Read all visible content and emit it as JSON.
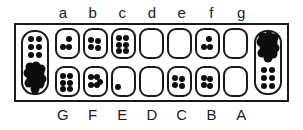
{
  "figure": {
    "board_type": "kalah",
    "frame_color": "#1a1a1a",
    "seed_color": "#0d0d0d",
    "background_color": "#ffffff"
  },
  "labels": {
    "top_row": [
      "a",
      "b",
      "c",
      "d",
      "e",
      "f",
      "g"
    ],
    "bottom_row": [
      "G",
      "F",
      "E",
      "D",
      "C",
      "B",
      "A"
    ]
  },
  "stores": {
    "left": {
      "name": "left-store",
      "upper_count": 6,
      "lower_count": 13,
      "total": 19
    },
    "right": {
      "name": "right-store",
      "upper_count": 13,
      "lower_count": 6,
      "total": 19
    }
  },
  "pits": {
    "top": [
      {
        "label": "a",
        "count": 3
      },
      {
        "label": "b",
        "count": 4
      },
      {
        "label": "c",
        "count": 6
      },
      {
        "label": "d",
        "count": 0
      },
      {
        "label": "e",
        "count": 0
      },
      {
        "label": "f",
        "count": 3
      },
      {
        "label": "g",
        "count": 0
      }
    ],
    "bottom": [
      {
        "label": "G",
        "count": 6
      },
      {
        "label": "F",
        "count": 5
      },
      {
        "label": "E",
        "count": 1
      },
      {
        "label": "D",
        "count": 0
      },
      {
        "label": "C",
        "count": 4
      },
      {
        "label": "B",
        "count": 4
      },
      {
        "label": "A",
        "count": 0
      }
    ]
  }
}
